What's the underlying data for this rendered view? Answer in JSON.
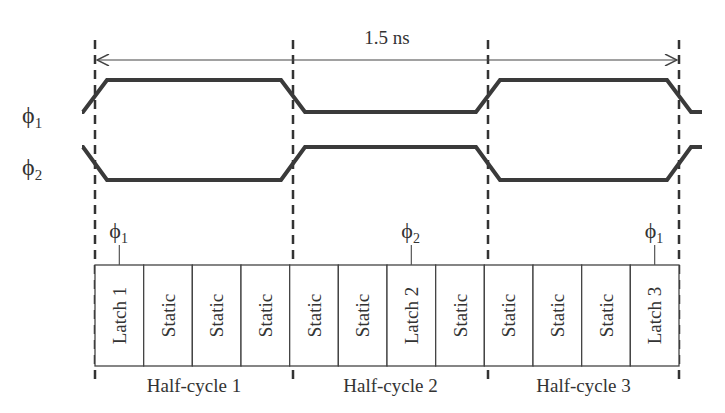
{
  "diagram": {
    "period_label": "1.5 ns",
    "signals": [
      {
        "name": "phi1",
        "label": "ϕ",
        "subscript": "1",
        "high_in_half_cycles": [
          1,
          3
        ]
      },
      {
        "name": "phi2",
        "label": "ϕ",
        "subscript": "2",
        "high_in_half_cycles": [
          2
        ]
      }
    ],
    "cells": [
      {
        "label": "Latch 1",
        "type": "latch",
        "clock": "1"
      },
      {
        "label": "Static",
        "type": "static"
      },
      {
        "label": "Static",
        "type": "static"
      },
      {
        "label": "Static",
        "type": "static"
      },
      {
        "label": "Static",
        "type": "static"
      },
      {
        "label": "Static",
        "type": "static"
      },
      {
        "label": "Latch 2",
        "type": "latch",
        "clock": "2"
      },
      {
        "label": "Static",
        "type": "static"
      },
      {
        "label": "Static",
        "type": "static"
      },
      {
        "label": "Static",
        "type": "static"
      },
      {
        "label": "Static",
        "type": "static"
      },
      {
        "label": "Latch 3",
        "type": "latch",
        "clock": "1"
      }
    ],
    "half_cycles": [
      "Half-cycle 1",
      "Half-cycle 2",
      "Half-cycle 3"
    ],
    "clock_label_symbol": "ϕ"
  }
}
